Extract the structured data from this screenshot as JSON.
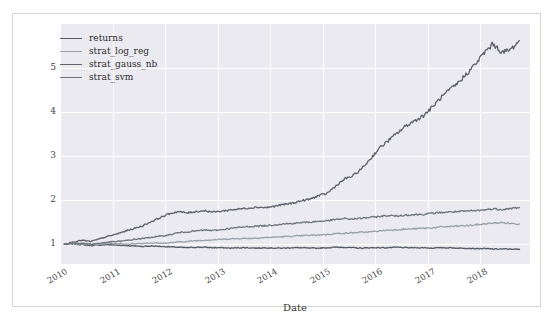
{
  "figure": {
    "background": "#ffffff",
    "plot_background": "#eaeaf0",
    "grid_color": "#ffffff"
  },
  "axes": {
    "xlabel": "Date",
    "ylabel": "",
    "xticks": [
      "2010",
      "2011",
      "2012",
      "2013",
      "2014",
      "2015",
      "2016",
      "2017",
      "2018"
    ],
    "yticks": [
      "1",
      "2",
      "3",
      "4",
      "5"
    ]
  },
  "legend": {
    "position": "upper-left",
    "entries": [
      {
        "label": "returns",
        "color": "#555a64"
      },
      {
        "label": "strat_log_reg",
        "color": "#9ba0a8"
      },
      {
        "label": "strat_gauss_nb",
        "color": "#5e6169"
      },
      {
        "label": "strat_svm",
        "color": "#6f737b"
      }
    ]
  },
  "chart_data": {
    "type": "line",
    "title": "",
    "xlabel": "Date",
    "ylabel": "",
    "xlim": [
      "2010-01",
      "2018-10"
    ],
    "ylim": [
      0.55,
      6.0
    ],
    "grid": true,
    "legend_position": "upper-left",
    "x": [
      "2010.08",
      "2010.25",
      "2010.42",
      "2010.58",
      "2010.75",
      "2010.92",
      "2011.08",
      "2011.25",
      "2011.42",
      "2011.58",
      "2011.75",
      "2011.92",
      "2012.08",
      "2012.25",
      "2012.42",
      "2012.58",
      "2012.75",
      "2012.92",
      "2013.08",
      "2013.25",
      "2013.42",
      "2013.58",
      "2013.75",
      "2013.92",
      "2014.08",
      "2014.25",
      "2014.42",
      "2014.58",
      "2014.75",
      "2014.92",
      "2015.08",
      "2015.25",
      "2015.42",
      "2015.58",
      "2015.75",
      "2015.92",
      "2016.08",
      "2016.25",
      "2016.42",
      "2016.58",
      "2016.75",
      "2016.92",
      "2017.08",
      "2017.25",
      "2017.42",
      "2017.58",
      "2017.75",
      "2017.92",
      "2018.08",
      "2018.25",
      "2018.42",
      "2018.58",
      "2018.75"
    ],
    "series": [
      {
        "name": "returns",
        "color": "#555a64",
        "values": [
          1.0,
          1.01,
          0.99,
          0.97,
          0.98,
          0.99,
          0.98,
          0.97,
          0.96,
          0.95,
          0.96,
          0.95,
          0.94,
          0.93,
          0.92,
          0.93,
          0.93,
          0.92,
          0.92,
          0.91,
          0.92,
          0.92,
          0.91,
          0.92,
          0.91,
          0.91,
          0.92,
          0.92,
          0.91,
          0.91,
          0.92,
          0.93,
          0.93,
          0.92,
          0.91,
          0.92,
          0.92,
          0.92,
          0.93,
          0.92,
          0.92,
          0.92,
          0.91,
          0.92,
          0.92,
          0.91,
          0.91,
          0.9,
          0.9,
          0.89,
          0.89,
          0.89,
          0.88
        ]
      },
      {
        "name": "strat_log_reg",
        "color": "#9ba0a8",
        "values": [
          1.0,
          1.02,
          1.01,
          0.99,
          1.0,
          1.02,
          1.01,
          1.0,
          1.01,
          1.02,
          1.03,
          1.02,
          1.03,
          1.05,
          1.06,
          1.08,
          1.09,
          1.1,
          1.11,
          1.12,
          1.13,
          1.13,
          1.14,
          1.15,
          1.16,
          1.17,
          1.18,
          1.19,
          1.2,
          1.21,
          1.22,
          1.24,
          1.25,
          1.26,
          1.27,
          1.28,
          1.3,
          1.32,
          1.33,
          1.34,
          1.35,
          1.36,
          1.37,
          1.39,
          1.4,
          1.41,
          1.42,
          1.44,
          1.46,
          1.48,
          1.49,
          1.47,
          1.46
        ]
      },
      {
        "name": "strat_gauss_nb",
        "color": "#5e6169",
        "values": [
          1.0,
          1.05,
          1.09,
          1.06,
          1.12,
          1.18,
          1.23,
          1.3,
          1.36,
          1.42,
          1.52,
          1.61,
          1.69,
          1.74,
          1.71,
          1.74,
          1.76,
          1.73,
          1.75,
          1.78,
          1.8,
          1.82,
          1.84,
          1.83,
          1.86,
          1.9,
          1.93,
          1.98,
          2.02,
          2.1,
          2.15,
          2.32,
          2.48,
          2.55,
          2.72,
          2.95,
          3.18,
          3.35,
          3.52,
          3.68,
          3.8,
          3.92,
          4.1,
          4.32,
          4.5,
          4.66,
          4.88,
          5.1,
          5.35,
          5.55,
          5.35,
          5.42,
          5.62
        ]
      },
      {
        "name": "strat_svm",
        "color": "#6f737b",
        "values": [
          1.0,
          1.03,
          1.02,
          1.0,
          1.02,
          1.05,
          1.06,
          1.08,
          1.11,
          1.13,
          1.16,
          1.18,
          1.21,
          1.26,
          1.28,
          1.3,
          1.32,
          1.31,
          1.33,
          1.36,
          1.38,
          1.4,
          1.41,
          1.42,
          1.44,
          1.46,
          1.47,
          1.49,
          1.5,
          1.52,
          1.53,
          1.56,
          1.58,
          1.57,
          1.59,
          1.61,
          1.63,
          1.65,
          1.64,
          1.66,
          1.67,
          1.68,
          1.7,
          1.72,
          1.73,
          1.74,
          1.75,
          1.76,
          1.78,
          1.8,
          1.79,
          1.81,
          1.83
        ]
      }
    ]
  }
}
